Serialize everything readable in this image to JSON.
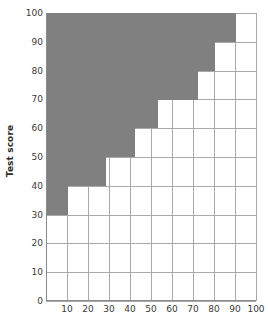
{
  "chart_data": {
    "type": "bar",
    "orientation": "horizontal",
    "title": "",
    "xlabel": "",
    "ylabel": "Test score",
    "xlim": [
      0,
      100
    ],
    "ylim": [
      0,
      100
    ],
    "grid": true,
    "legend": null,
    "bar_color": "#808080",
    "grid_color": "#a9a9a9",
    "axis_color": "#8a8a8a",
    "xticks": [
      0,
      10,
      20,
      30,
      40,
      50,
      60,
      70,
      80,
      90,
      100
    ],
    "xtick_labels": [
      "0",
      "10",
      "20",
      "30",
      "40",
      "50",
      "60",
      "70",
      "80",
      "90",
      "100"
    ],
    "yticks": [
      0,
      10,
      20,
      30,
      40,
      50,
      60,
      70,
      80,
      90,
      100
    ],
    "ytick_labels": [
      "0",
      "10",
      "20",
      "30",
      "40",
      "50",
      "60",
      "70",
      "80",
      "90",
      "100"
    ],
    "categories": [
      "30-40",
      "40-50",
      "50-60",
      "60-70",
      "70-80",
      "80-90",
      "90-100"
    ],
    "bars": [
      {
        "label": "30-40",
        "y_low": 30,
        "y_high": 40,
        "value": 10
      },
      {
        "label": "40-50",
        "y_low": 40,
        "y_high": 50,
        "value": 28
      },
      {
        "label": "50-60",
        "y_low": 50,
        "y_high": 60,
        "value": 42
      },
      {
        "label": "60-70",
        "y_low": 60,
        "y_high": 70,
        "value": 53
      },
      {
        "label": "70-80",
        "y_low": 70,
        "y_high": 80,
        "value": 72
      },
      {
        "label": "80-90",
        "y_low": 80,
        "y_high": 90,
        "value": 80
      },
      {
        "label": "90-100",
        "y_low": 90,
        "y_high": 100,
        "value": 90
      }
    ],
    "values": [
      10,
      28,
      42,
      53,
      72,
      80,
      90
    ]
  }
}
